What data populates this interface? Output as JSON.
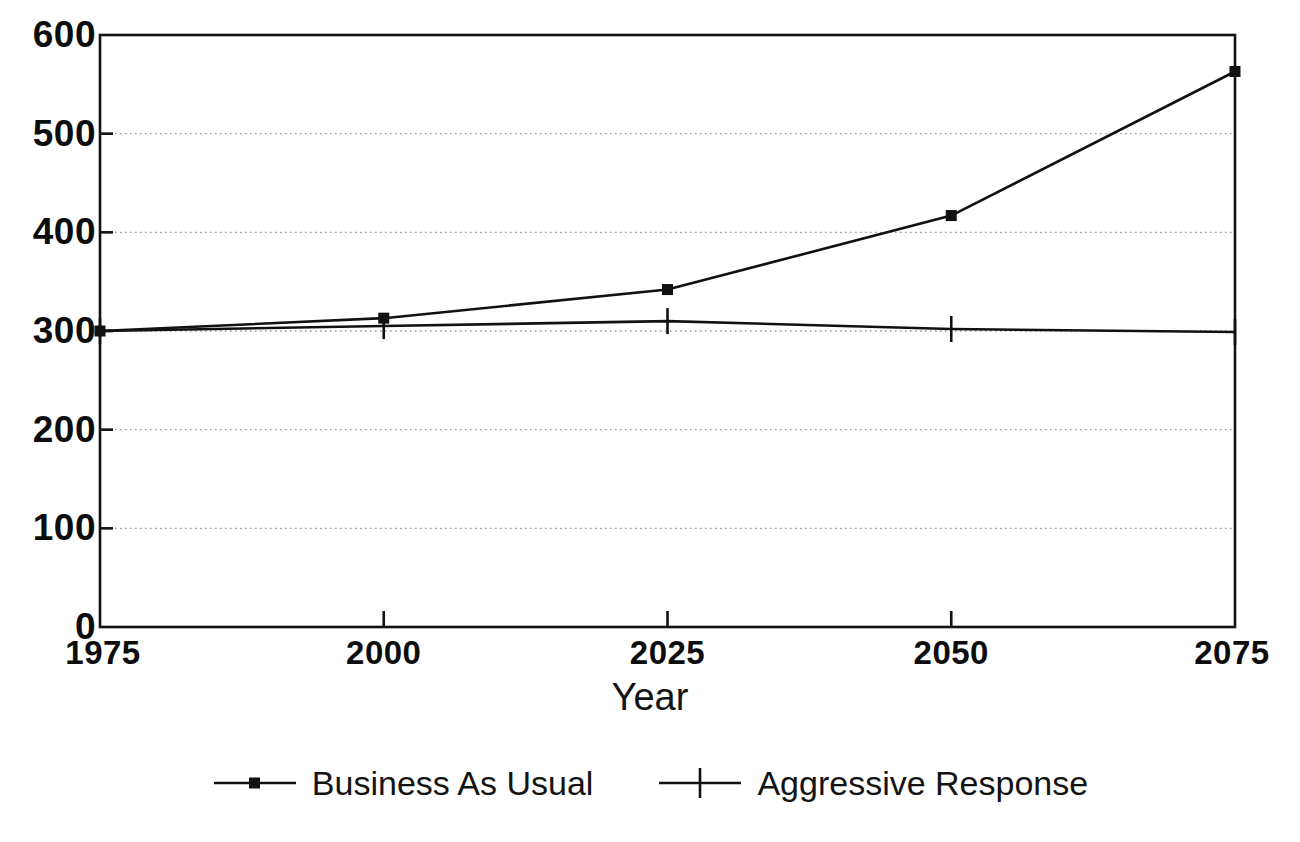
{
  "chart_data": {
    "type": "line",
    "title": "",
    "subtitle": "",
    "xlabel": "Year",
    "ylabel": "",
    "x": [
      1975,
      2000,
      2025,
      2050,
      2075
    ],
    "xlim": [
      1975,
      2075
    ],
    "ylim": [
      0,
      600
    ],
    "xticks": [
      "1975",
      "2000",
      "2025",
      "2050",
      "2075"
    ],
    "yticks": [
      "0",
      "100",
      "200",
      "300",
      "400",
      "500",
      "600"
    ],
    "ytick_values": [
      0,
      100,
      200,
      300,
      400,
      500,
      600
    ],
    "grid": "horizontal-dotted",
    "legend_position": "bottom-center",
    "series": [
      {
        "name": "Business As Usual",
        "marker": "square",
        "color": "#111111",
        "values": [
          300,
          313,
          342,
          417,
          563
        ]
      },
      {
        "name": "Aggressive Response",
        "marker": "plus",
        "color": "#111111",
        "values": [
          300,
          305,
          310,
          302,
          299
        ]
      }
    ]
  },
  "axes": {
    "x_title": "Year",
    "x_tick_labels": [
      "1975",
      "2000",
      "2025",
      "2050",
      "2075"
    ],
    "y_tick_labels": [
      "600",
      "500",
      "400",
      "300",
      "200",
      "100",
      "0"
    ]
  },
  "legend": {
    "entries": [
      {
        "label": "Business As Usual",
        "marker": "square-line-marker"
      },
      {
        "label": "Aggressive Response",
        "marker": "plus-line-marker"
      }
    ]
  },
  "colors": {
    "ink": "#111111",
    "grid": "#9a9a9a",
    "background": "#ffffff"
  }
}
